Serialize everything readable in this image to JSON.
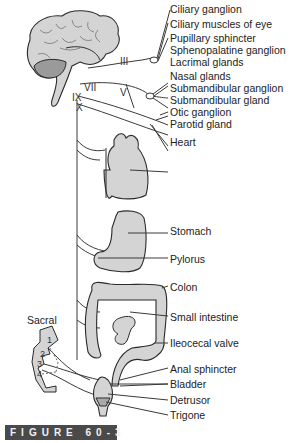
{
  "figure": {
    "caption": "FIGURE 60-3"
  },
  "cranial_nerves": [
    {
      "label": "III",
      "x": 120,
      "y": 57
    },
    {
      "label": "VII",
      "x": 84,
      "y": 83
    },
    {
      "label": "V",
      "x": 120,
      "y": 90
    },
    {
      "label": "IX",
      "x": 72,
      "y": 94
    },
    {
      "label": "X",
      "x": 76,
      "y": 104
    }
  ],
  "region_labels": {
    "sacral": "Sacral",
    "sacral_segments": [
      "1",
      "2",
      "3",
      "4"
    ]
  },
  "targets": [
    {
      "label": "Ciliary ganglion",
      "y": 3
    },
    {
      "label": "Ciliary muscles of eye",
      "y": 18
    },
    {
      "label": "Pupillary sphincter",
      "y": 32
    },
    {
      "label": "Sphenopalatine ganglion",
      "y": 44
    },
    {
      "label": "Lacrimal glands",
      "y": 56
    },
    {
      "label": "Nasal glands",
      "y": 70
    },
    {
      "label": "Submandibular ganglion",
      "y": 82
    },
    {
      "label": "Submandibular gland",
      "y": 94
    },
    {
      "label": "Otic ganglion",
      "y": 106
    },
    {
      "label": "Parotid gland",
      "y": 118
    },
    {
      "label": "Heart",
      "y": 136
    },
    {
      "label": "Stomach",
      "y": 225
    },
    {
      "label": "Pylorus",
      "y": 253
    },
    {
      "label": "Colon",
      "y": 281
    },
    {
      "label": "Small intestine",
      "y": 311
    },
    {
      "label": "Ileocecal valve",
      "y": 337
    },
    {
      "label": "Anal sphincter",
      "y": 363
    },
    {
      "label": "Bladder",
      "y": 378
    },
    {
      "label": "Detrusor",
      "y": 394
    },
    {
      "label": "Trigone",
      "y": 409
    }
  ],
  "colors": {
    "organ_fill": "#d4d4d4",
    "line": "#3a3a3a",
    "caption_bg": "#4a4a4a",
    "caption_text": "#f0f0f0"
  }
}
